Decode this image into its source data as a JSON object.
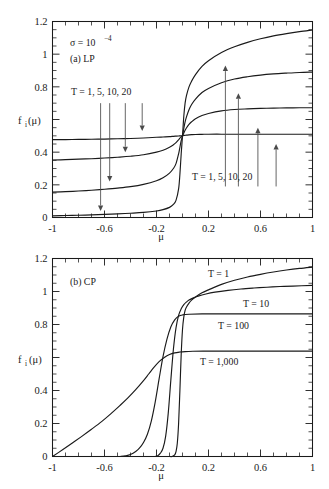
{
  "figure": {
    "title": "",
    "panels": [
      "(a) LP",
      "(b) CP"
    ]
  },
  "chart_data": [
    {
      "type": "line",
      "panel_id": "a",
      "panel_label": "(a) LP",
      "title": "",
      "subtitle": "",
      "annotations": [
        {
          "text": "σ = 10",
          "exponent": "−4",
          "x": -0.72,
          "y": 1.02
        },
        {
          "text": "(a) LP",
          "x": -0.72,
          "y": 0.92
        },
        {
          "text": "T = 1, 5, 10, 20",
          "x": -0.6,
          "y": 0.73
        },
        {
          "text": "T = 1, 5, 10, 20",
          "x": 0.33,
          "y": 0.22
        }
      ],
      "xlabel": "μ",
      "ylabel": "f_i(μ)",
      "xlim": [
        -1,
        1
      ],
      "ylim": [
        0,
        1.2
      ],
      "xticks": [
        -1,
        -0.6,
        -0.2,
        0.2,
        0.6,
        1
      ],
      "xtick_labels": [
        "-1",
        "-0.6",
        "-0.2",
        "0.2",
        "0.6",
        "1"
      ],
      "yticks": [
        0,
        0.2,
        0.4,
        0.6,
        0.8,
        1,
        1.2
      ],
      "ytick_labels": [
        "0",
        "0.2",
        "0.4",
        "0.6",
        "0.8",
        "1",
        "1.2"
      ],
      "ytick_labels_shown": [
        "0",
        "0.2",
        "0.4",
        "0.8",
        "1",
        "1.2"
      ],
      "grid": false,
      "legend": "inline-annotations",
      "series": [
        {
          "name": "T = 1",
          "x": [
            -1.0,
            -0.9,
            -0.8,
            -0.7,
            -0.6,
            -0.5,
            -0.4,
            -0.3,
            -0.2,
            -0.15,
            -0.1,
            -0.07,
            -0.05,
            -0.03,
            -0.02,
            -0.01,
            0.0,
            0.01,
            0.02,
            0.03,
            0.05,
            0.07,
            0.1,
            0.15,
            0.2,
            0.3,
            0.4,
            0.5,
            0.6,
            0.7,
            0.8,
            0.9,
            1.0
          ],
          "y": [
            0.01,
            0.012,
            0.014,
            0.016,
            0.019,
            0.022,
            0.026,
            0.031,
            0.04,
            0.048,
            0.062,
            0.08,
            0.105,
            0.175,
            0.265,
            0.39,
            0.5,
            0.62,
            0.7,
            0.745,
            0.8,
            0.835,
            0.875,
            0.925,
            0.96,
            1.01,
            1.045,
            1.072,
            1.094,
            1.112,
            1.126,
            1.138,
            1.148
          ]
        },
        {
          "name": "T = 5",
          "x": [
            -1.0,
            -0.9,
            -0.8,
            -0.7,
            -0.6,
            -0.5,
            -0.4,
            -0.3,
            -0.2,
            -0.15,
            -0.1,
            -0.07,
            -0.05,
            -0.03,
            -0.02,
            -0.01,
            0.0,
            0.01,
            0.02,
            0.03,
            0.05,
            0.07,
            0.1,
            0.15,
            0.2,
            0.3,
            0.4,
            0.5,
            0.6,
            0.7,
            0.8,
            0.9,
            1.0
          ],
          "y": [
            0.155,
            0.158,
            0.162,
            0.167,
            0.173,
            0.18,
            0.189,
            0.203,
            0.225,
            0.243,
            0.272,
            0.3,
            0.33,
            0.39,
            0.43,
            0.47,
            0.5,
            0.545,
            0.585,
            0.615,
            0.66,
            0.692,
            0.725,
            0.765,
            0.79,
            0.825,
            0.848,
            0.862,
            0.872,
            0.879,
            0.884,
            0.888,
            0.89
          ]
        },
        {
          "name": "T = 10",
          "x": [
            -1.0,
            -0.9,
            -0.8,
            -0.7,
            -0.6,
            -0.5,
            -0.4,
            -0.3,
            -0.2,
            -0.15,
            -0.1,
            -0.07,
            -0.05,
            -0.03,
            -0.02,
            -0.01,
            0.0,
            0.01,
            0.02,
            0.03,
            0.05,
            0.07,
            0.1,
            0.15,
            0.2,
            0.3,
            0.4,
            0.5,
            0.6,
            0.7,
            0.8,
            0.9,
            1.0
          ],
          "y": [
            0.352,
            0.354,
            0.357,
            0.36,
            0.364,
            0.369,
            0.375,
            0.384,
            0.4,
            0.412,
            0.43,
            0.445,
            0.458,
            0.476,
            0.486,
            0.494,
            0.5,
            0.517,
            0.534,
            0.548,
            0.57,
            0.586,
            0.604,
            0.624,
            0.637,
            0.653,
            0.661,
            0.665,
            0.668,
            0.67,
            0.671,
            0.672,
            0.672
          ]
        },
        {
          "name": "T = 20",
          "x": [
            -1.0,
            -0.9,
            -0.8,
            -0.7,
            -0.6,
            -0.5,
            -0.4,
            -0.3,
            -0.2,
            -0.15,
            -0.1,
            -0.07,
            -0.05,
            -0.03,
            -0.02,
            -0.01,
            0.0,
            0.01,
            0.02,
            0.03,
            0.05,
            0.07,
            0.1,
            0.15,
            0.2,
            0.3,
            0.4,
            0.5,
            0.6,
            0.7,
            0.8,
            0.9,
            1.0
          ],
          "y": [
            0.477,
            0.477,
            0.478,
            0.479,
            0.48,
            0.482,
            0.484,
            0.487,
            0.491,
            0.493,
            0.495,
            0.497,
            0.498,
            0.499,
            0.5,
            0.5,
            0.5,
            0.502,
            0.503,
            0.504,
            0.506,
            0.507,
            0.508,
            0.509,
            0.51,
            0.51,
            0.51,
            0.51,
            0.51,
            0.51,
            0.51,
            0.51,
            0.51
          ]
        }
      ],
      "arrows_down": [
        {
          "x": -0.63,
          "y_from": 0.7,
          "y_to": 0.04
        },
        {
          "x": -0.56,
          "y_from": 0.7,
          "y_to": 0.22
        },
        {
          "x": -0.44,
          "y_from": 0.7,
          "y_to": 0.4
        },
        {
          "x": -0.31,
          "y_from": 0.7,
          "y_to": 0.53
        }
      ],
      "arrows_up": [
        {
          "x": 0.33,
          "y_from": 0.19,
          "y_to": 0.93
        },
        {
          "x": 0.43,
          "y_from": 0.19,
          "y_to": 0.76
        },
        {
          "x": 0.58,
          "y_from": 0.19,
          "y_to": 0.55
        },
        {
          "x": 0.72,
          "y_from": 0.19,
          "y_to": 0.45
        }
      ]
    },
    {
      "type": "line",
      "panel_id": "b",
      "panel_label": "(b) CP",
      "title": "",
      "annotations": [
        {
          "text": "(b) CP",
          "x": -0.74,
          "y": 1.02
        },
        {
          "text": "T = 1",
          "x": 0.29,
          "y": 1.1
        },
        {
          "text": "T = 10",
          "x": 0.52,
          "y": 0.93
        },
        {
          "text": "T = 100",
          "x": 0.38,
          "y": 0.78
        },
        {
          "text": "T = 1,000",
          "x": 0.32,
          "y": 0.56
        }
      ],
      "xlabel": "μ",
      "ylabel": "f_i(μ)",
      "xlim": [
        -1,
        1
      ],
      "ylim": [
        0,
        1.2
      ],
      "xticks": [
        -1,
        -0.6,
        -0.2,
        0.2,
        0.6,
        1
      ],
      "xtick_labels": [
        "-1",
        "-0.6",
        "-0.2",
        "0.2",
        "0.6",
        "1"
      ],
      "yticks": [
        0,
        0.2,
        0.4,
        0.6,
        0.8,
        1,
        1.2
      ],
      "ytick_labels": [
        "0",
        "0.2",
        "0.4",
        "0.6",
        "0.8",
        "1",
        "1.2"
      ],
      "ytick_labels_shown": [
        "0",
        "0.2",
        "0.4",
        "0.8",
        "1",
        "1.2"
      ],
      "grid": false,
      "legend": "inline-annotations",
      "series": [
        {
          "name": "T = 1",
          "x": [
            -0.1,
            -0.08,
            -0.06,
            -0.05,
            -0.04,
            -0.03,
            -0.02,
            -0.01,
            0.0,
            0.01,
            0.02,
            0.03,
            0.05,
            0.07,
            0.1,
            0.15,
            0.2,
            0.3,
            0.4,
            0.5,
            0.6,
            0.7,
            0.8,
            0.9,
            1.0
          ],
          "y": [
            0.0,
            0.0,
            0.01,
            0.03,
            0.08,
            0.2,
            0.4,
            0.62,
            0.77,
            0.845,
            0.885,
            0.905,
            0.93,
            0.948,
            0.967,
            0.992,
            1.01,
            1.043,
            1.068,
            1.088,
            1.104,
            1.118,
            1.13,
            1.14,
            1.148
          ]
        },
        {
          "name": "T = 10",
          "x": [
            -0.21,
            -0.19,
            -0.17,
            -0.15,
            -0.13,
            -0.11,
            -0.09,
            -0.07,
            -0.05,
            -0.03,
            -0.01,
            0.01,
            0.03,
            0.05,
            0.08,
            0.12,
            0.18,
            0.25,
            0.35,
            0.45,
            0.55,
            0.65,
            0.75,
            0.85,
            1.0
          ],
          "y": [
            0.0,
            0.005,
            0.02,
            0.05,
            0.12,
            0.26,
            0.46,
            0.65,
            0.78,
            0.855,
            0.895,
            0.92,
            0.936,
            0.948,
            0.96,
            0.972,
            0.985,
            0.996,
            1.007,
            1.015,
            1.021,
            1.026,
            1.03,
            1.033,
            1.037
          ]
        },
        {
          "name": "T = 100",
          "x": [
            -0.48,
            -0.44,
            -0.4,
            -0.36,
            -0.33,
            -0.3,
            -0.27,
            -0.24,
            -0.21,
            -0.18,
            -0.15,
            -0.12,
            -0.09,
            -0.06,
            -0.03,
            0.0,
            0.05,
            0.15,
            0.3,
            0.5,
            0.7,
            0.85,
            1.0
          ],
          "y": [
            0.0,
            0.004,
            0.012,
            0.03,
            0.052,
            0.085,
            0.135,
            0.215,
            0.33,
            0.47,
            0.605,
            0.71,
            0.785,
            0.828,
            0.85,
            0.858,
            0.862,
            0.864,
            0.864,
            0.864,
            0.864,
            0.864,
            0.864
          ]
        },
        {
          "name": "T = 1,000",
          "x": [
            -1.0,
            -0.92,
            -0.85,
            -0.78,
            -0.7,
            -0.62,
            -0.55,
            -0.48,
            -0.42,
            -0.36,
            -0.3,
            -0.26,
            -0.22,
            -0.18,
            -0.14,
            -0.1,
            -0.06,
            -0.02,
            0.02,
            0.08,
            0.16,
            0.3,
            0.5,
            0.7,
            0.85,
            1.0
          ],
          "y": [
            0.0,
            0.042,
            0.08,
            0.119,
            0.165,
            0.213,
            0.26,
            0.31,
            0.355,
            0.405,
            0.46,
            0.5,
            0.54,
            0.575,
            0.6,
            0.618,
            0.628,
            0.633,
            0.636,
            0.638,
            0.639,
            0.639,
            0.639,
            0.639,
            0.639,
            0.639
          ]
        }
      ]
    }
  ]
}
